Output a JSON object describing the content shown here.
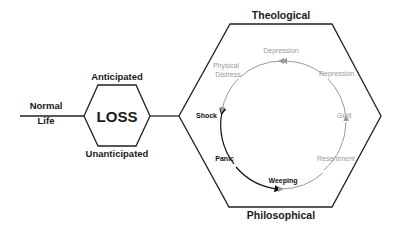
{
  "diagram": {
    "start": {
      "line1": "Normal",
      "line2": "Life"
    },
    "loss": {
      "title": "LOSS",
      "top_label": "Anticipated",
      "bottom_label": "Unanticipated"
    },
    "frame": {
      "top_label": "Theological",
      "bottom_label": "Philosophical"
    },
    "cycle": {
      "active_color": "#111111",
      "inactive_color": "#9a9a9a",
      "stages": [
        {
          "id": "shock",
          "label": "Shock",
          "active": true
        },
        {
          "id": "panic",
          "label": "Panic",
          "active": true
        },
        {
          "id": "weeping",
          "label": "Weeping",
          "active": true
        },
        {
          "id": "resentment",
          "label": "Resentment",
          "active": false
        },
        {
          "id": "guilt",
          "label": "Guilt",
          "active": false
        },
        {
          "id": "repression",
          "label": "Repression",
          "active": false
        },
        {
          "id": "depression",
          "label": "Depression",
          "active": false
        },
        {
          "id": "physical-distress",
          "line1": "Physical",
          "line2": "Distress",
          "active": false
        }
      ]
    }
  }
}
